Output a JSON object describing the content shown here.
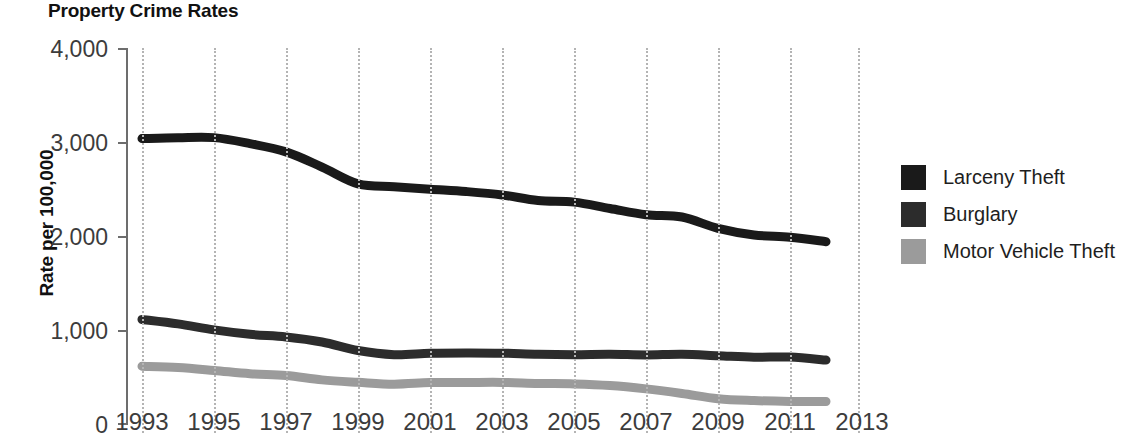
{
  "chart_title": "Property Crime Rates",
  "axes": {
    "ylabel": "Rate per 100,000",
    "xlabel": "",
    "y_ticks": [
      "0",
      "1,000",
      "2,000",
      "3,000",
      "4,000"
    ],
    "x_ticks": [
      "1993",
      "1995",
      "1997",
      "1999",
      "2001",
      "2003",
      "2005",
      "2007",
      "2009",
      "2011",
      "2013"
    ]
  },
  "legend": {
    "items": [
      {
        "label": "Larceny Theft",
        "color": "#1a1a1a"
      },
      {
        "label": "Burglary",
        "color": "#2c2c2c"
      },
      {
        "label": "Motor Vehicle Theft",
        "color": "#9b9b9b"
      }
    ]
  },
  "chart_data": {
    "type": "line",
    "title": "Property Crime Rates",
    "xlabel": "",
    "ylabel": "Rate per 100,000",
    "xlim": [
      1993,
      2013
    ],
    "ylim": [
      0,
      4000
    ],
    "grid": "vertical-dotted",
    "legend_position": "right",
    "x": [
      1993,
      1994,
      1995,
      1996,
      1997,
      1998,
      1999,
      2000,
      2001,
      2002,
      2003,
      2004,
      2005,
      2006,
      2007,
      2008,
      2009,
      2010,
      2011,
      2012
    ],
    "series": [
      {
        "name": "Larceny Theft",
        "color": "#1a1a1a",
        "values": [
          3034,
          3043,
          3044,
          2980,
          2892,
          2730,
          2551,
          2521,
          2494,
          2469,
          2433,
          2373,
          2356,
          2288,
          2222,
          2197,
          2076,
          2006,
          1981,
          1934
        ]
      },
      {
        "name": "Burglary",
        "color": "#2c2c2c",
        "values": [
          1105,
          1057,
          993,
          946,
          918,
          864,
          773,
          729,
          744,
          748,
          745,
          733,
          729,
          733,
          726,
          733,
          718,
          702,
          703,
          671
        ]
      },
      {
        "name": "Motor Vehicle Theft",
        "color": "#9b9b9b",
        "values": [
          606,
          592,
          561,
          526,
          506,
          460,
          434,
          414,
          431,
          432,
          433,
          422,
          417,
          400,
          364,
          315,
          259,
          239,
          230,
          229
        ]
      }
    ]
  }
}
